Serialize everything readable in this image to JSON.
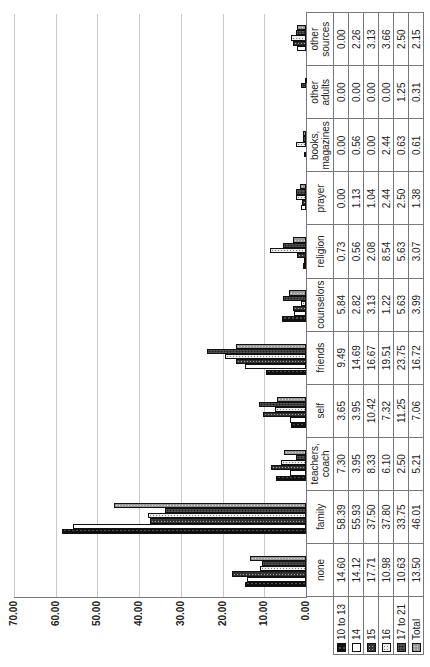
{
  "chart_data": {
    "type": "bar",
    "orientation": "rotated-90-ccw",
    "title": "",
    "xlabel": "",
    "ylabel": "",
    "ylim": [
      0,
      70
    ],
    "yticks": [
      "0.00",
      "10.00",
      "20.00",
      "30.00",
      "40.00",
      "50.00",
      "60.00",
      "70.00"
    ],
    "grid": true,
    "legend_position": "table-left",
    "has_data_table": true,
    "categories": [
      "none",
      "family",
      "teachers, coach",
      "self",
      "friends",
      "counselors",
      "religion",
      "prayer",
      "books, magazines",
      "other adults",
      "other sources"
    ],
    "series": [
      {
        "name": "10 to 13",
        "values": [
          14.6,
          58.39,
          7.3,
          3.65,
          9.49,
          5.84,
          0.73,
          0.0,
          0.0,
          0.0,
          0.0
        ]
      },
      {
        "name": "14",
        "values": [
          14.12,
          55.93,
          3.95,
          3.95,
          14.69,
          2.82,
          0.56,
          1.13,
          0.56,
          0.0,
          2.26
        ]
      },
      {
        "name": "15",
        "values": [
          17.71,
          37.5,
          8.33,
          10.42,
          16.67,
          3.13,
          2.08,
          1.04,
          0.0,
          0.0,
          3.13
        ]
      },
      {
        "name": "16",
        "values": [
          10.98,
          37.8,
          6.1,
          7.32,
          19.51,
          1.22,
          8.54,
          2.44,
          2.44,
          0.0,
          3.66
        ]
      },
      {
        "name": "17 to 21",
        "values": [
          10.63,
          33.75,
          2.5,
          11.25,
          23.75,
          5.63,
          5.63,
          2.5,
          0.63,
          1.25,
          2.5
        ]
      },
      {
        "name": "Total",
        "values": [
          13.5,
          46.01,
          5.21,
          7.06,
          16.72,
          3.99,
          3.07,
          1.38,
          0.61,
          0.31,
          2.15
        ]
      }
    ],
    "display_values": [
      [
        "14.60",
        "58.39",
        "7.30",
        "3.65",
        "9.49",
        "5.84",
        "0.73",
        "0.00",
        "0.00",
        "0.00",
        "0.00"
      ],
      [
        "14.12",
        "55.93",
        "3.95",
        "3.95",
        "14.69",
        "2.82",
        "0.56",
        "1.13",
        "0.56",
        "0.00",
        "2.26"
      ],
      [
        "17.71",
        "37.50",
        "8.33",
        "10.42",
        "16.67",
        "3.13",
        "2.08",
        "1.04",
        "0.00",
        "0.00",
        "3.13"
      ],
      [
        "10.98",
        "37.80",
        "6.10",
        "7.32",
        "19.51",
        "1.22",
        "8.54",
        "2.44",
        "2.44",
        "0.00",
        "3.66"
      ],
      [
        "10.63",
        "33.75",
        "2.50",
        "11.25",
        "23.75",
        "5.63",
        "5.63",
        "2.50",
        "0.63",
        "1.25",
        "2.50"
      ],
      [
        "13.50",
        "46.01",
        "5.21",
        "7.06",
        "16.72",
        "3.99",
        "3.07",
        "1.38",
        "0.61",
        "0.31",
        "2.15"
      ]
    ]
  }
}
